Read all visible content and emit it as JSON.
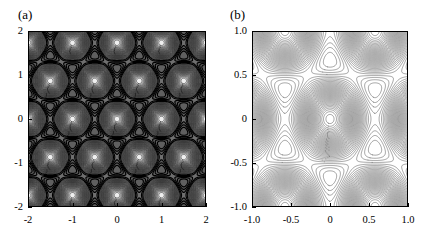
{
  "figure": {
    "background": "#ffffff",
    "width": 438,
    "height": 242
  },
  "panels": [
    {
      "id": "a",
      "label": "(a)",
      "plot": {
        "x": 28,
        "y": 31,
        "width": 178,
        "height": 176
      },
      "label_pos": {
        "x": 18,
        "y": 8
      }
    },
    {
      "id": "b",
      "label": "(b)",
      "plot": {
        "x": 252,
        "y": 31,
        "width": 156,
        "height": 176
      },
      "label_pos": {
        "x": 230,
        "y": 8
      }
    }
  ],
  "chart_data": [
    {
      "type": "contour",
      "panel": "a",
      "title": "(a)",
      "xlabel": "",
      "ylabel": "",
      "xlim": [
        -2,
        2
      ],
      "ylim": [
        -2,
        2
      ],
      "xticks": [
        -2,
        -1,
        0,
        1,
        2
      ],
      "xticklabels": [
        "-2",
        "-1",
        "0",
        "1",
        "2"
      ],
      "yticks": [
        -2,
        -1,
        0,
        1,
        2
      ],
      "yticklabels": [
        "-2",
        "-1",
        "0",
        "1",
        "2"
      ],
      "grid": false,
      "legend": false,
      "colormap": "grayscale",
      "shaded": true,
      "description": "Hexagonal (honeycomb) lattice of nested circular contour wells separated by dark ridge lines; triangular saddle junctions at the ridge vertices.",
      "lattice": {
        "type": "triangular",
        "a1": [
          1.0,
          0.0
        ],
        "a2": [
          0.5,
          0.8660254
        ],
        "well_centers": [
          [
            0,
            0
          ],
          [
            1,
            0
          ],
          [
            -1,
            0
          ],
          [
            2,
            0
          ],
          [
            -2,
            0
          ],
          [
            0.5,
            0.866
          ],
          [
            -0.5,
            0.866
          ],
          [
            1.5,
            0.866
          ],
          [
            -1.5,
            0.866
          ],
          [
            0,
            1.732
          ],
          [
            1,
            1.732
          ],
          [
            -1,
            1.732
          ],
          [
            2,
            1.732
          ],
          [
            -2,
            1.732
          ],
          [
            0.5,
            -0.866
          ],
          [
            -0.5,
            -0.866
          ],
          [
            1.5,
            -0.866
          ],
          [
            -1.5,
            -0.866
          ],
          [
            0,
            -1.732
          ],
          [
            1,
            -1.732
          ],
          [
            -1,
            -1.732
          ],
          [
            2,
            -1.732
          ],
          [
            -2,
            -1.732
          ]
        ]
      },
      "field": {
        "formula": "cos(k1.r) + cos(k2.r) + cos(k3.r)",
        "k_magnitude": 7.2551975,
        "k_directions_deg": [
          90,
          210,
          330
        ],
        "range": [
          -1.5,
          3.0
        ]
      },
      "levels": [
        -1.35,
        -1.2,
        -1.05,
        -0.9,
        -0.75,
        -0.6,
        -0.45,
        -0.3,
        -0.15,
        0.0,
        0.15,
        0.3,
        0.45,
        0.6,
        0.75,
        0.9,
        1.05,
        1.2,
        1.35,
        1.5,
        1.65,
        1.8,
        1.95,
        2.1,
        2.25,
        2.4,
        2.55,
        2.7,
        2.85
      ],
      "n_levels": 29,
      "line_color": "#1a1a1a",
      "line_width": 0.55
    },
    {
      "type": "contour",
      "panel": "b",
      "title": "(b)",
      "xlabel": "",
      "ylabel": "",
      "xlim": [
        -1.0,
        1.0
      ],
      "ylim": [
        -1.0,
        1.0
      ],
      "xticks": [
        -1.0,
        -0.5,
        0,
        0.5,
        1.0
      ],
      "xticklabels": [
        "-1.0",
        "-0.5",
        "0",
        "0.5",
        "1.0"
      ],
      "yticks": [
        -1.0,
        -0.5,
        0,
        0.5,
        1.0
      ],
      "yticklabels": [
        "-1.0",
        "-0.5",
        "0",
        "0.5",
        "1.0"
      ],
      "grid": false,
      "legend": false,
      "colormap": "none",
      "shaded": false,
      "description": "Line-contour map with one large circular well at the origin, smaller triangular wells at the hexagon corners, and X-shaped saddle crossings between them.",
      "field": {
        "formula": "cos(k1.r) + cos(k2.r) + cos(k3.r)",
        "k_magnitude": 6.2831853,
        "k_directions_deg": [
          90,
          210,
          330
        ],
        "range": [
          -1.5,
          3.0
        ]
      },
      "levels": [
        -1.4,
        -1.28,
        -1.16,
        -1.04,
        -0.92,
        -0.8,
        -0.68,
        -0.56,
        -0.44,
        -0.32,
        -0.2,
        -0.08,
        0.04,
        0.16,
        0.28,
        0.4,
        0.52,
        0.64,
        0.76,
        0.88,
        1.0,
        1.12,
        1.24,
        1.36,
        1.48,
        1.6,
        1.72,
        1.84,
        1.96,
        2.08,
        2.2,
        2.32,
        2.44,
        2.56,
        2.68,
        2.8,
        2.92
      ],
      "n_levels": 37,
      "line_color": "#333333",
      "line_width": 0.45
    }
  ]
}
